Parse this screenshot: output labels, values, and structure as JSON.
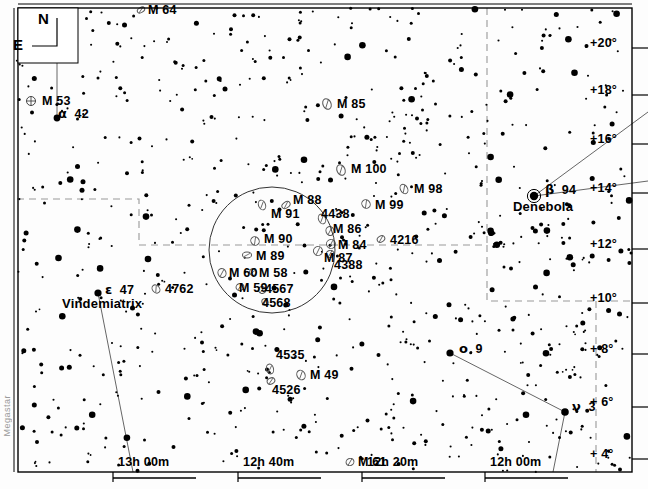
{
  "chart": {
    "watermark": "Megastar",
    "width": 648,
    "height": 489,
    "border_color": "#000000",
    "star_color": "#000000",
    "galaxy_color": "#555555",
    "boundary_color": "#999999",
    "constellation_line_color": "#666666"
  },
  "compass": {
    "north_label": "N",
    "east_label": "E"
  },
  "axes": {
    "ra_label_name": "Right Ascension",
    "dec_label_name": "Declination",
    "ra_ticks": [
      {
        "label": "13h 00m",
        "x": 118
      },
      {
        "label": "12h 40m",
        "x": 243
      },
      {
        "label": "12h 20m",
        "x": 367
      },
      {
        "label": "12h 00m",
        "x": 490
      }
    ],
    "dec_ticks": [
      {
        "label": "+20°",
        "y": 45
      },
      {
        "label": "+18°",
        "y": 92
      },
      {
        "label": "+16°",
        "y": 141
      },
      {
        "label": "+14°",
        "y": 190
      },
      {
        "label": "+12°",
        "y": 246
      },
      {
        "label": "+10°",
        "y": 300
      },
      {
        "label": "+ 8°",
        "y": 351
      },
      {
        "label": "+ 6°",
        "y": 404
      },
      {
        "label": "+ 4°",
        "y": 456
      }
    ]
  },
  "field_circle": {
    "name": "finder-field-circle",
    "cx": 272,
    "cy": 250,
    "r": 63
  },
  "deep_sky_objects": [
    {
      "label": "M 64",
      "sym": "galaxy",
      "sx": 141,
      "sy": 10,
      "lx": 148,
      "ly": 3,
      "w": 8,
      "h": 5,
      "rot": -30
    },
    {
      "label": "M 53",
      "sym": "globular",
      "sx": 31,
      "sy": 101,
      "lx": 42,
      "ly": 94,
      "w": 9,
      "h": 9,
      "rot": 0
    },
    {
      "label": "M 85",
      "sym": "galaxy",
      "sx": 327,
      "sy": 104,
      "lx": 337,
      "ly": 97,
      "w": 8,
      "h": 11,
      "rot": -25
    },
    {
      "label": "M 100",
      "sym": "galaxy",
      "sx": 341,
      "sy": 170,
      "lx": 351,
      "ly": 162,
      "w": 8,
      "h": 11,
      "rot": -25
    },
    {
      "label": "M 98",
      "sym": "galaxy",
      "sx": 404,
      "sy": 189,
      "lx": 414,
      "ly": 182,
      "w": 7,
      "h": 10,
      "rot": -30
    },
    {
      "label": "M 99",
      "sym": "galaxy",
      "sx": 366,
      "sy": 204,
      "lx": 375,
      "ly": 198,
      "w": 8,
      "h": 9,
      "rot": -40
    },
    {
      "label": "M 88",
      "sym": "galaxy",
      "sx": 286,
      "sy": 205,
      "lx": 293,
      "ly": 193,
      "w": 9,
      "h": 6,
      "rot": -35
    },
    {
      "label": "M 91",
      "sym": "galaxy",
      "sx": 262,
      "sy": 205,
      "lx": 271,
      "ly": 207,
      "w": 7,
      "h": 10,
      "rot": -20
    },
    {
      "label": "4438",
      "sym": "galaxy",
      "sx": 322,
      "sy": 219,
      "lx": 321,
      "ly": 207,
      "w": 7,
      "h": 10,
      "rot": -20
    },
    {
      "label": "M 86",
      "sym": "galaxy",
      "sx": 330,
      "sy": 231,
      "lx": 333,
      "ly": 222,
      "w": 8,
      "h": 9,
      "rot": -20
    },
    {
      "label": "M 90",
      "sym": "galaxy",
      "sx": 255,
      "sy": 241,
      "lx": 264,
      "ly": 232,
      "w": 8,
      "h": 9,
      "rot": -40
    },
    {
      "label": "M 84",
      "sym": "galaxy",
      "sx": 331,
      "sy": 244,
      "lx": 338,
      "ly": 238,
      "w": 9,
      "h": 9,
      "rot": -25
    },
    {
      "label": "4216",
      "sym": "galaxy",
      "sx": 381,
      "sy": 239,
      "lx": 390,
      "ly": 233,
      "w": 8,
      "h": 6,
      "rot": -30
    },
    {
      "label": "M 89",
      "sym": "galaxy",
      "sx": 247,
      "sy": 255,
      "lx": 256,
      "ly": 249,
      "w": 9,
      "h": 6,
      "rot": 0
    },
    {
      "label": "M 87",
      "sym": "galaxy",
      "sx": 318,
      "sy": 251,
      "lx": 324,
      "ly": 251,
      "w": 9,
      "h": 9,
      "rot": -25
    },
    {
      "label": "4388",
      "sym": "galaxy",
      "sx": 330,
      "sy": 254,
      "lx": 334,
      "ly": 258,
      "w": 8,
      "h": 7,
      "rot": -25
    },
    {
      "label": "M 60",
      "sym": "galaxy",
      "sx": 222,
      "sy": 273,
      "lx": 229,
      "ly": 266,
      "w": 8,
      "h": 9,
      "rot": -20
    },
    {
      "label": "M 58",
      "sym": "galaxy",
      "sx": 253,
      "sy": 272,
      "lx": 259,
      "ly": 266,
      "w": 7,
      "h": 7,
      "rot": 0
    },
    {
      "label": "M 59",
      "sym": "galaxy",
      "sx": 240,
      "sy": 287,
      "lx": 239,
      "ly": 281,
      "w": 8,
      "h": 7,
      "rot": -20
    },
    {
      "label": "4567",
      "sym": "galaxy",
      "sx": 262,
      "sy": 290,
      "lx": 265,
      "ly": 282,
      "w": 7,
      "h": 7,
      "rot": -20
    },
    {
      "label": "4568",
      "sym": "galaxy",
      "sx": 265,
      "sy": 302,
      "lx": 262,
      "ly": 296,
      "w": 6,
      "h": 7,
      "rot": -20
    },
    {
      "label": "4762",
      "sym": "galaxy",
      "sx": 156,
      "sy": 289,
      "lx": 165,
      "ly": 282,
      "w": 7,
      "h": 9,
      "rot": -40
    },
    {
      "label": "4535",
      "sym": "galaxy",
      "sx": 270,
      "sy": 369,
      "lx": 276,
      "ly": 348,
      "w": 7,
      "h": 10,
      "rot": -15
    },
    {
      "label": "M 49",
      "sym": "galaxy",
      "sx": 301,
      "sy": 375,
      "lx": 310,
      "ly": 368,
      "w": 8,
      "h": 10,
      "rot": -25
    },
    {
      "label": "4526",
      "sym": "galaxy",
      "sx": 271,
      "sy": 381,
      "lx": 272,
      "ly": 383,
      "w": 8,
      "h": 6,
      "rot": -25
    },
    {
      "label": "M 61",
      "sym": "galaxy",
      "sx": 350,
      "sy": 462,
      "lx": 358,
      "ly": 455,
      "w": 8,
      "h": 7,
      "rot": -25
    }
  ],
  "named_stars": [
    {
      "bayer": "α",
      "flam": "42",
      "proper": "",
      "sx": 57,
      "sy": 118,
      "r": 3.4,
      "lx": 58,
      "ly": 106,
      "plx": 0,
      "ply": 0,
      "double": false
    },
    {
      "bayer": "ε",
      "flam": "47",
      "proper": "Vindemiatrix",
      "sx": 98,
      "sy": 293,
      "r": 3.6,
      "lx": 105,
      "ly": 282,
      "plx": 62,
      "ply": 296,
      "double": false
    },
    {
      "bayer": "β",
      "flam": "94",
      "proper": "Denebola",
      "sx": 534,
      "sy": 196,
      "r": 4.2,
      "lx": 545,
      "ly": 182,
      "plx": 513,
      "ply": 199,
      "double": true
    },
    {
      "bayer": "ο",
      "flam": "9",
      "proper": "",
      "sx": 450,
      "sy": 353,
      "r": 3.6,
      "lx": 459,
      "ly": 341,
      "plx": 0,
      "ply": 0,
      "double": false
    },
    {
      "bayer": "ν",
      "flam": "3",
      "proper": "",
      "sx": 565,
      "sy": 412,
      "r": 3.8,
      "lx": 572,
      "ly": 399,
      "plx": 0,
      "ply": 0,
      "double": false
    }
  ],
  "constellation_lines": [
    {
      "name": "denebola-to-upper-right",
      "x1": 534,
      "y1": 196,
      "x2": 648,
      "y2": 112
    },
    {
      "name": "denebola-to-right",
      "x1": 534,
      "y1": 196,
      "x2": 648,
      "y2": 181
    },
    {
      "name": "vindemiatrix-to-south",
      "x1": 98,
      "y1": 293,
      "x2": 133,
      "y2": 472
    },
    {
      "name": "omicron-to-nu",
      "x1": 450,
      "y1": 353,
      "x2": 565,
      "y2": 412
    },
    {
      "name": "nu-to-south",
      "x1": 565,
      "y1": 412,
      "x2": 553,
      "y2": 472
    },
    {
      "name": "north-indicator",
      "x1": 57,
      "y1": 118,
      "x2": 57,
      "y2": 18
    }
  ],
  "constellation_boundaries": [
    {
      "name": "coma-virgo-boundary",
      "points": "17,199 112,199 112,199 139,199 139,245 339,245 487,245"
    },
    {
      "name": "boundary-vertical-upper",
      "points": "487,8 487,245"
    },
    {
      "name": "boundary-right-block",
      "points": "487,245 487,301 632,301"
    },
    {
      "name": "boundary-lower-vertical",
      "points": "596,301 596,472"
    }
  ]
}
